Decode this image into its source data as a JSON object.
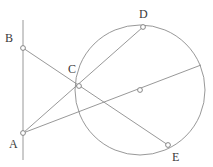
{
  "figure": {
    "width": 213,
    "height": 167,
    "background_color": "#ffffff",
    "stroke_color": "#8c8c8c",
    "label_color": "#3a3a3a",
    "marker_fill": "#ffffff"
  },
  "labels": {
    "A": "A",
    "B": "B",
    "C": "C",
    "D": "D",
    "E": "E"
  },
  "points": [
    {
      "name": "A",
      "label": "A",
      "x": 23,
      "y": 133,
      "label_x": 14,
      "label_y": 148,
      "marker": true
    },
    {
      "name": "B",
      "label": "B",
      "x": 23,
      "y": 48,
      "label_x": 8,
      "label_y": 39,
      "marker": true
    },
    {
      "name": "C",
      "label": "C",
      "x": 79,
      "y": 86,
      "label_x": 70,
      "label_y": 72,
      "marker": true
    },
    {
      "name": "D",
      "label": "D",
      "x": 143,
      "y": 27,
      "label_x": 140,
      "label_y": 17,
      "marker": true
    },
    {
      "name": "E",
      "label": "E",
      "x": 168,
      "y": 145,
      "label_x": 174,
      "label_y": 160,
      "marker": true
    },
    {
      "name": "O",
      "label": "",
      "x": 140,
      "y": 90,
      "label_x": 0,
      "label_y": 0,
      "marker": true
    }
  ],
  "circle": {
    "center_x": 140,
    "center_y": 90,
    "radius": 65
  },
  "segments": [
    {
      "name": "vertical-line-AB",
      "x1": 23,
      "y1": 20,
      "x2": 23,
      "y2": 160
    },
    {
      "name": "segment-B-to-E",
      "x1": 23,
      "y1": 48,
      "x2": 168,
      "y2": 145
    },
    {
      "name": "segment-A-to-D",
      "x1": 23,
      "y1": 133,
      "x2": 143,
      "y2": 27
    },
    {
      "name": "secant-A-through-O",
      "x1": 23,
      "y1": 133,
      "x2": 201,
      "y2": 65
    }
  ]
}
